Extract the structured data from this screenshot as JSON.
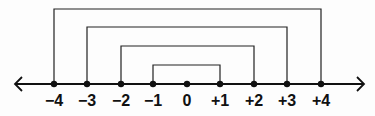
{
  "diagram": {
    "type": "number-line-with-opposite-pair-brackets",
    "axis": {
      "min": -4,
      "max": 4,
      "arrows": "both"
    },
    "points": [
      {
        "value": -4,
        "label": "−4",
        "x": 54
      },
      {
        "value": -3,
        "label": "−3",
        "x": 87
      },
      {
        "value": -2,
        "label": "−2",
        "x": 121
      },
      {
        "value": -1,
        "label": "−1",
        "x": 153
      },
      {
        "value": 0,
        "label": "0",
        "x": 187
      },
      {
        "value": 1,
        "label": "+1",
        "x": 220
      },
      {
        "value": 2,
        "label": "+2",
        "x": 254
      },
      {
        "value": 3,
        "label": "+3",
        "x": 287
      },
      {
        "value": 4,
        "label": "+4",
        "x": 321
      }
    ],
    "brackets": [
      {
        "pair": "-4 to +4",
        "from": -4,
        "to": 4,
        "top_y": 9
      },
      {
        "pair": "-3 to +3",
        "from": -3,
        "to": 3,
        "top_y": 27
      },
      {
        "pair": "-2 to +2",
        "from": -2,
        "to": 2,
        "top_y": 46
      },
      {
        "pair": "-1 to +1",
        "from": -1,
        "to": 1,
        "top_y": 65
      }
    ],
    "colors": {
      "line": "#111111",
      "background": "#fdfdfd"
    }
  }
}
